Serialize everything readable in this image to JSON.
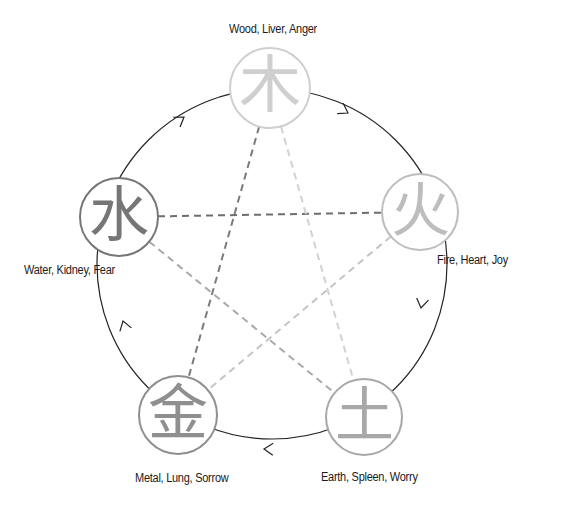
{
  "cycle_stroke": "#222222",
  "outer_circle": {
    "cx": 272,
    "cy": 264,
    "r": 175
  },
  "elements": [
    {
      "id": "wood",
      "glyph": "木",
      "label": "Wood, Liver, Anger",
      "cx": 270,
      "cy": 88,
      "r": 40,
      "color": "#cfcfcf",
      "label_x": 229,
      "label_y": 22
    },
    {
      "id": "fire",
      "glyph": "火",
      "label": "Fire, Heart, Joy",
      "cx": 420,
      "cy": 212,
      "r": 38,
      "color": "#bdbdbd",
      "label_x": 437,
      "label_y": 253
    },
    {
      "id": "earth",
      "glyph": "土",
      "label": "Earth, Spleen, Worry",
      "cx": 364,
      "cy": 417,
      "r": 38,
      "color": "#a8a8a8",
      "label_x": 321,
      "label_y": 470
    },
    {
      "id": "metal",
      "glyph": "金",
      "label": "Metal, Lung, Sorrow",
      "cx": 178,
      "cy": 415,
      "r": 39,
      "color": "#8f8f8f",
      "label_x": 135,
      "label_y": 471
    },
    {
      "id": "water",
      "glyph": "水",
      "label": "Water, Kidney, Fear",
      "cx": 119,
      "cy": 217,
      "r": 39,
      "color": "#767676",
      "label_x": 24,
      "label_y": 263
    }
  ],
  "generating_cycle": {
    "direction": "clockwise",
    "arrows": [
      {
        "x": 348,
        "y": 113,
        "angle": 30
      },
      {
        "x": 421,
        "y": 308,
        "angle": 100
      },
      {
        "x": 264,
        "y": 449,
        "angle": 182
      },
      {
        "x": 123,
        "y": 321,
        "angle": 253
      },
      {
        "x": 184,
        "y": 117,
        "angle": 325
      }
    ]
  },
  "controlling_cycle": [
    {
      "from": "water",
      "to": "fire",
      "color": "#6e6e6e"
    },
    {
      "from": "wood",
      "to": "metal",
      "color": "#7a7a7a"
    },
    {
      "from": "wood",
      "to": "earth",
      "color": "#d2d2d2"
    },
    {
      "from": "fire",
      "to": "metal",
      "color": "#c4c4c4"
    },
    {
      "from": "water",
      "to": "earth",
      "color": "#a9a9a9"
    }
  ]
}
